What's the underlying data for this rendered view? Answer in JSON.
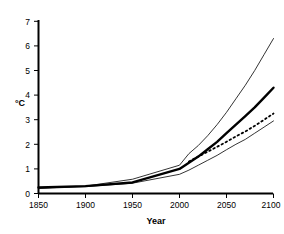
{
  "chart_data": {
    "type": "line",
    "title": "",
    "subtitle": "",
    "xlabel": "Year",
    "ylabel": "°C",
    "xlim": [
      1850,
      2100
    ],
    "ylim": [
      0,
      7
    ],
    "xticks": [
      1850,
      1900,
      1950,
      2000,
      2050,
      2100
    ],
    "yticks": [
      0,
      1,
      2,
      3,
      4,
      5,
      6,
      7
    ],
    "grid": false,
    "legend": null,
    "x": [
      1850,
      1900,
      1950,
      2000,
      2010,
      2020,
      2030,
      2040,
      2050,
      2060,
      2070,
      2080,
      2090,
      2100
    ],
    "series": [
      {
        "name": "upper-bound",
        "style": "thin-solid",
        "color": "#000000",
        "width": 0.8,
        "values": [
          0.22,
          0.3,
          0.58,
          1.15,
          1.62,
          1.95,
          2.35,
          2.8,
          3.3,
          3.85,
          4.4,
          5.0,
          5.65,
          6.3
        ]
      },
      {
        "name": "central-estimate",
        "style": "thick-solid",
        "color": "#000000",
        "width": 2.4,
        "values": [
          0.25,
          0.3,
          0.45,
          1.0,
          1.25,
          1.5,
          1.8,
          2.1,
          2.45,
          2.8,
          3.15,
          3.5,
          3.9,
          4.3
        ]
      },
      {
        "name": "alternate-scenario",
        "style": "dotted",
        "color": "#000000",
        "width": 1.8,
        "values": [
          null,
          null,
          null,
          null,
          1.3,
          1.5,
          1.7,
          1.9,
          2.1,
          2.32,
          2.52,
          2.75,
          3.0,
          3.25
        ]
      },
      {
        "name": "lower-bound",
        "style": "thin-solid",
        "color": "#000000",
        "width": 0.8,
        "values": [
          0.2,
          0.28,
          0.42,
          0.78,
          0.95,
          1.15,
          1.35,
          1.55,
          1.78,
          2.0,
          2.2,
          2.45,
          2.7,
          2.95
        ]
      }
    ]
  },
  "axes": {
    "x_tick_labels": [
      "1850",
      "1900",
      "1950",
      "2000",
      "2050",
      "2100"
    ],
    "y_tick_labels": [
      "0",
      "1",
      "2",
      "3",
      "4",
      "5",
      "6",
      "7"
    ],
    "x_axis_title": "Year",
    "y_axis_title": "°C"
  },
  "colors": {
    "axis": "#000000",
    "line": "#000000",
    "background": "#ffffff"
  }
}
